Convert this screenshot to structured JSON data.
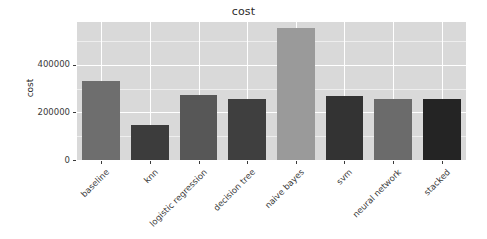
{
  "chart_data": {
    "type": "bar",
    "title": "cost",
    "xlabel": "",
    "ylabel": "cost",
    "categories": [
      "baseline",
      "knn",
      "logistic regression",
      "decision tree",
      "naive bayes",
      "svm",
      "neural network",
      "stacked"
    ],
    "values": [
      331000,
      146000,
      275000,
      258000,
      555000,
      271000,
      258000,
      258000
    ],
    "ylim": [
      0,
      580000
    ],
    "ytick_values": [
      0,
      200000,
      400000
    ],
    "ytick_labels": [
      "0",
      "200000",
      "400000"
    ],
    "grid": true,
    "legend": "none",
    "bar_colors": [
      "#6e6e6e",
      "#3c3c3c",
      "#575757",
      "#3f3f3f",
      "#9a9a9a",
      "#333333",
      "#6b6b6b",
      "#242424"
    ],
    "panel_background": "#d9d9d9",
    "grid_color": "#ffffff",
    "axis_text_color": "#3a3a3a"
  }
}
